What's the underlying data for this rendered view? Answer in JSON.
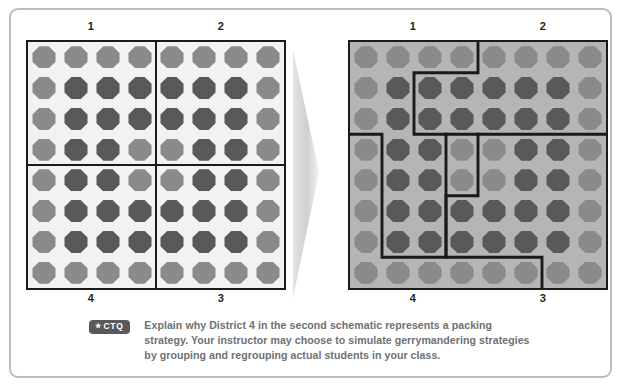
{
  "figure": {
    "arrow_icon": "right-arrow-triangle",
    "colors": {
      "frame_border": "#bcbcbc",
      "grid_border": "#1a1a1a",
      "left_grid_background": "#f2f2f0",
      "right_grid_background": "#b5b5b5",
      "dot_light": "#8a8a8a",
      "dot_dark": "#595959",
      "badge_background": "#58595b",
      "caption_text": "#6f7173"
    }
  },
  "schematic_left": {
    "name": "first-schematic",
    "labels_top": [
      "1",
      "2"
    ],
    "labels_bottom": [
      "4",
      "3"
    ],
    "rows": 8,
    "cols": 8,
    "dots": [
      [
        "light",
        "light",
        "light",
        "light",
        "light",
        "light",
        "light",
        "light"
      ],
      [
        "light",
        "dark",
        "dark",
        "dark",
        "dark",
        "dark",
        "dark",
        "light"
      ],
      [
        "light",
        "dark",
        "dark",
        "dark",
        "dark",
        "dark",
        "dark",
        "light"
      ],
      [
        "light",
        "dark",
        "dark",
        "light",
        "light",
        "dark",
        "dark",
        "light"
      ],
      [
        "light",
        "dark",
        "dark",
        "light",
        "light",
        "dark",
        "dark",
        "light"
      ],
      [
        "light",
        "dark",
        "dark",
        "dark",
        "dark",
        "dark",
        "dark",
        "light"
      ],
      [
        "light",
        "dark",
        "dark",
        "dark",
        "dark",
        "dark",
        "dark",
        "light"
      ],
      [
        "light",
        "light",
        "light",
        "light",
        "light",
        "light",
        "light",
        "light"
      ]
    ]
  },
  "schematic_right": {
    "name": "second-schematic",
    "labels_top": [
      "1",
      "2"
    ],
    "labels_bottom": [
      "4",
      "3"
    ],
    "rows": 8,
    "cols": 8,
    "dots": [
      [
        "light",
        "light",
        "light",
        "light",
        "light",
        "light",
        "light",
        "light"
      ],
      [
        "light",
        "dark",
        "dark",
        "dark",
        "dark",
        "dark",
        "dark",
        "light"
      ],
      [
        "light",
        "dark",
        "dark",
        "dark",
        "dark",
        "dark",
        "dark",
        "light"
      ],
      [
        "light",
        "dark",
        "dark",
        "light",
        "light",
        "dark",
        "dark",
        "light"
      ],
      [
        "light",
        "dark",
        "dark",
        "light",
        "light",
        "dark",
        "dark",
        "light"
      ],
      [
        "light",
        "dark",
        "dark",
        "dark",
        "dark",
        "dark",
        "dark",
        "light"
      ],
      [
        "light",
        "dark",
        "dark",
        "dark",
        "dark",
        "dark",
        "dark",
        "light"
      ],
      [
        "light",
        "light",
        "light",
        "light",
        "light",
        "light",
        "light",
        "light"
      ]
    ]
  },
  "caption": {
    "badge_star": "★",
    "badge_label": "CTQ",
    "text": "Explain why District 4 in the second schematic represents a packing strategy. Your instructor may choose to simulate gerrymandering strategies by grouping and regrouping actual students in your class."
  }
}
